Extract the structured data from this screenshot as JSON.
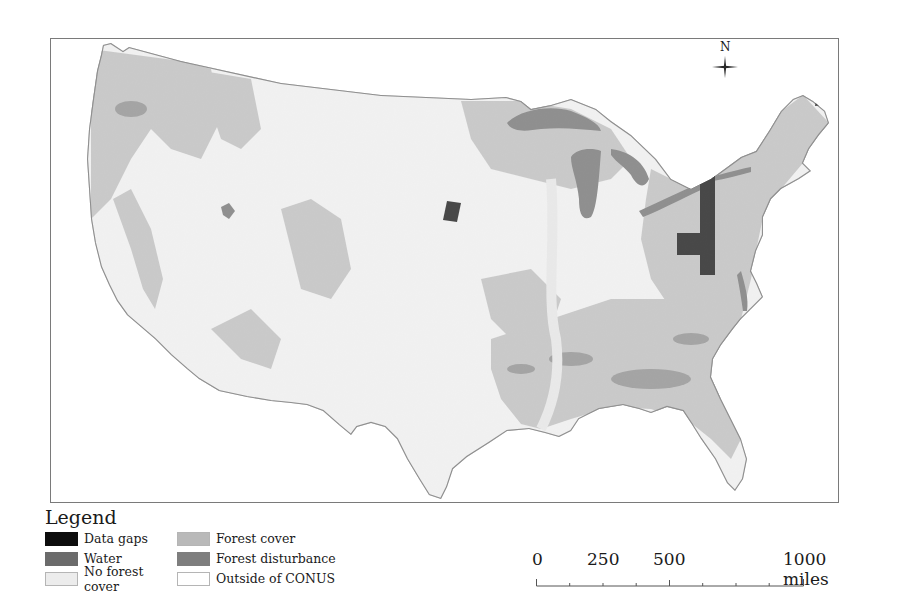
{
  "map": {
    "region": "Conterminous United States (CONUS)",
    "compass": {
      "label": "N"
    },
    "colors": {
      "data_gaps": "#0d0d0d",
      "water": "#6b6b6b",
      "no_forest_cover": "#ececec",
      "forest_cover": "#b9b9b9",
      "forest_disturbance": "#7e7e7e",
      "outside_conus": "#ffffff",
      "frame": "#7a7a7a"
    },
    "data_gap_regions": [
      {
        "name": "central-plains-gap",
        "approx_location": "Nebraska/South Dakota border"
      },
      {
        "name": "appalachian-gap",
        "approx_location": "Pennsylvania / West Virginia / Virginia"
      },
      {
        "name": "northern-maine-gap",
        "approx_location": "Northern Maine"
      }
    ]
  },
  "legend": {
    "title": "Legend",
    "items": [
      {
        "label": "Data gaps",
        "color": "#0d0d0d"
      },
      {
        "label": "Forest cover",
        "color": "#b9b9b9"
      },
      {
        "label": "Water",
        "color": "#6b6b6b"
      },
      {
        "label": "Forest disturbance",
        "color": "#7e7e7e"
      },
      {
        "label": "No forest cover",
        "color": "#ececec"
      },
      {
        "label": "Outside of CONUS",
        "color": "#ffffff"
      }
    ]
  },
  "scale_bar": {
    "labels": [
      "0",
      "250",
      "500",
      "1000 miles"
    ],
    "unit": "miles",
    "max": 1000,
    "major_ticks": [
      0,
      500,
      1000
    ],
    "minor_tick_interval": 125
  }
}
